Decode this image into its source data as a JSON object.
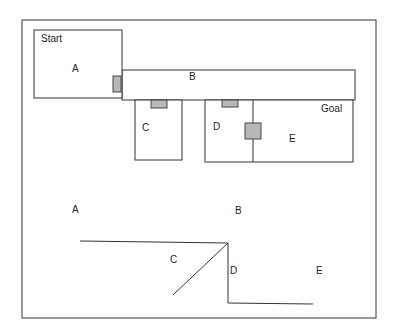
{
  "floorplan": {
    "start_label": "Start",
    "goal_label": "Goal",
    "rooms": [
      {
        "id": "A",
        "label": "A"
      },
      {
        "id": "B",
        "label": "B"
      },
      {
        "id": "C",
        "label": "C"
      },
      {
        "id": "D",
        "label": "D"
      },
      {
        "id": "E",
        "label": "E"
      }
    ],
    "doors": [
      "A-B",
      "B-C",
      "B-D",
      "D-E"
    ]
  },
  "graph": {
    "nodes": [
      {
        "id": "A",
        "label": "A"
      },
      {
        "id": "B",
        "label": "B"
      },
      {
        "id": "C",
        "label": "C"
      },
      {
        "id": "D",
        "label": "D"
      },
      {
        "id": "E",
        "label": "E"
      }
    ]
  },
  "colors": {
    "line": "#333333",
    "door": "#b8b8b8",
    "background": "#ffffff"
  }
}
